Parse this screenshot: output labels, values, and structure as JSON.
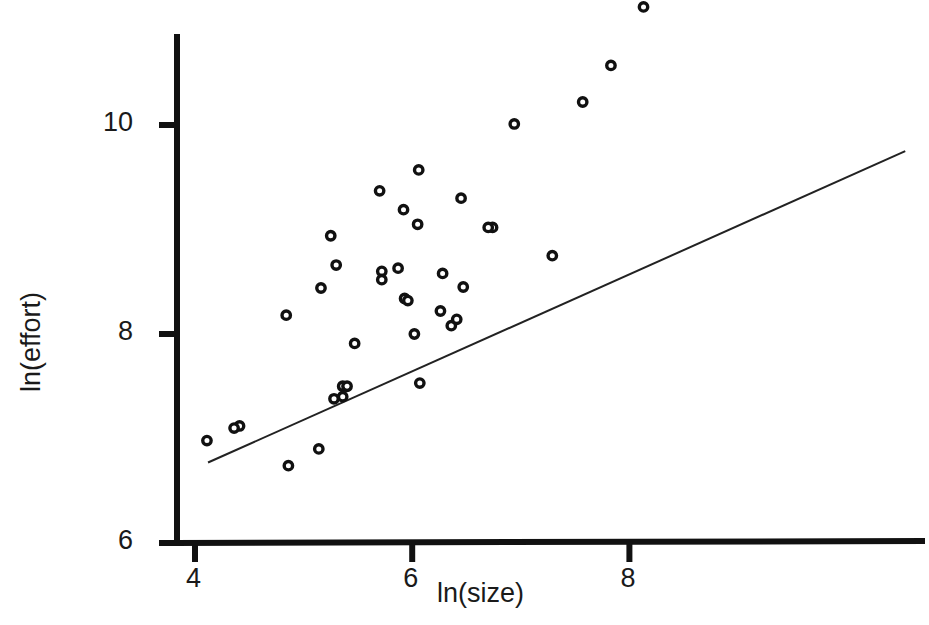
{
  "chart_data": {
    "type": "scatter",
    "title": "",
    "xlabel": "ln(size)",
    "ylabel": "ln(effort)",
    "xlim": [
      3.85,
      8.3
    ],
    "ylim": [
      5.85,
      12.1
    ],
    "xticks": [
      "4",
      "6",
      "8"
    ],
    "xtick_values": [
      4,
      6,
      8
    ],
    "yticks": [
      "6",
      "8",
      "10",
      "12"
    ],
    "ytick_values": [
      6,
      8,
      10,
      12
    ],
    "grid": false,
    "legend": null,
    "marker": "open-circle",
    "points": [
      {
        "x": 4.11,
        "y": 6.98
      },
      {
        "x": 4.41,
        "y": 7.12
      },
      {
        "x": 4.36,
        "y": 7.1
      },
      {
        "x": 5.36,
        "y": 7.5
      },
      {
        "x": 5.4,
        "y": 7.5
      },
      {
        "x": 5.36,
        "y": 7.4
      },
      {
        "x": 5.28,
        "y": 7.38
      },
      {
        "x": 5.14,
        "y": 6.9
      },
      {
        "x": 4.86,
        "y": 6.74
      },
      {
        "x": 4.84,
        "y": 8.18
      },
      {
        "x": 5.16,
        "y": 8.44
      },
      {
        "x": 5.3,
        "y": 8.66
      },
      {
        "x": 5.25,
        "y": 8.94
      },
      {
        "x": 5.47,
        "y": 7.91
      },
      {
        "x": 5.72,
        "y": 8.6
      },
      {
        "x": 5.72,
        "y": 8.52
      },
      {
        "x": 5.7,
        "y": 9.37
      },
      {
        "x": 5.93,
        "y": 8.34
      },
      {
        "x": 5.96,
        "y": 8.32
      },
      {
        "x": 5.92,
        "y": 9.19
      },
      {
        "x": 5.87,
        "y": 8.63
      },
      {
        "x": 6.02,
        "y": 8.0
      },
      {
        "x": 6.06,
        "y": 9.57
      },
      {
        "x": 6.05,
        "y": 9.05
      },
      {
        "x": 6.07,
        "y": 7.53
      },
      {
        "x": 6.28,
        "y": 8.58
      },
      {
        "x": 6.26,
        "y": 8.22
      },
      {
        "x": 6.36,
        "y": 8.08
      },
      {
        "x": 6.41,
        "y": 8.14
      },
      {
        "x": 6.47,
        "y": 8.45
      },
      {
        "x": 6.45,
        "y": 9.3
      },
      {
        "x": 6.74,
        "y": 9.02
      },
      {
        "x": 6.7,
        "y": 9.02
      },
      {
        "x": 6.94,
        "y": 10.01
      },
      {
        "x": 7.29,
        "y": 8.75
      },
      {
        "x": 7.57,
        "y": 10.22
      },
      {
        "x": 7.83,
        "y": 10.57
      },
      {
        "x": 8.13,
        "y": 11.13
      }
    ],
    "fit_line": {
      "type": "linear-regression",
      "x_start": 4.12,
      "y_start": 6.77,
      "x_end": 10.54,
      "y_end": 9.75
    }
  },
  "axes": {
    "x_tick_labels": [
      "4",
      "6",
      "8"
    ],
    "y_tick_labels": [
      "12",
      "10",
      "8",
      "6"
    ],
    "x_axis_title": "ln(size)",
    "y_axis_title": "ln(effort)"
  },
  "style": {
    "foreground": "#111111",
    "background": "#ffffff",
    "marker_color": "#111111",
    "line_color": "#222222"
  }
}
